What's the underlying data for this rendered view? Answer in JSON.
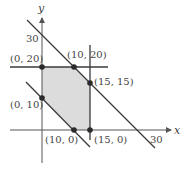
{
  "diagram": {
    "type": "feasible-region",
    "colors": {
      "region_fill": "#dcdcdc",
      "line": "#3a3a3a",
      "axis": "#555555",
      "point": "#2a2a2a",
      "text": "#444444"
    },
    "axes": {
      "x_label": "x",
      "y_label": "y",
      "x_tick_label": "30",
      "y_tick_label": "30"
    },
    "vertices": [
      {
        "label": "(0, 20)"
      },
      {
        "label": "(10, 20)"
      },
      {
        "label": "(15, 15)"
      },
      {
        "label": "(0, 10)"
      },
      {
        "label": "(10, 0)"
      },
      {
        "label": "(15, 0)"
      }
    ],
    "boundary_lines": [
      "x + y = 30",
      "x + y = 10",
      "y = 20",
      "x = 15"
    ]
  }
}
